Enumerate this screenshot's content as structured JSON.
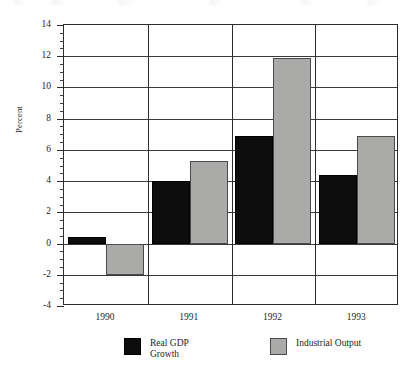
{
  "chart_data": {
    "type": "bar",
    "title": "",
    "xlabel": "",
    "ylabel": "Percent",
    "categories": [
      "1990",
      "1991",
      "1992",
      "1993"
    ],
    "series": [
      {
        "name": "Real GDP\nGrowth",
        "legend_label": "Real GDP\nGrowth",
        "color": "#0d0d0d",
        "values": [
          0.4,
          4.0,
          6.9,
          4.4
        ]
      },
      {
        "name": "Industrial Output",
        "legend_label": "Industrial Output",
        "color": "#aaaaa8",
        "values": [
          -2.0,
          5.3,
          11.9,
          6.9
        ]
      }
    ],
    "ylim": [
      -4,
      14
    ],
    "ytick_values": [
      -4,
      -2,
      0,
      2,
      4,
      6,
      8,
      10,
      12,
      14
    ],
    "ytick_labels": [
      "-4",
      "-2",
      "0",
      "2",
      "4",
      "6",
      "8",
      "10",
      "12",
      "14"
    ],
    "minor_tick_step": 0.5,
    "grid": true,
    "grid_axis": "both",
    "legend_position": "bottom"
  },
  "axis": {
    "y_title": "Percent"
  }
}
